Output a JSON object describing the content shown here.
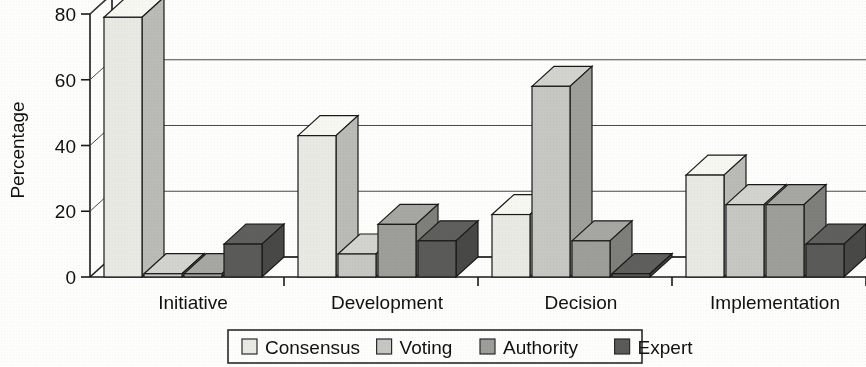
{
  "chart_data": {
    "type": "bar",
    "title": "",
    "subtitle": "",
    "xlabel": "",
    "ylabel": "Percentage",
    "ylim": [
      0,
      80
    ],
    "yticks": [
      0,
      20,
      40,
      60,
      80
    ],
    "ytick_labels": [
      "0",
      "20",
      "40",
      "60",
      "80"
    ],
    "grid": true,
    "three_d": true,
    "legend_position": "bottom",
    "categories": [
      "Initiative",
      "Development",
      "Decision",
      "Implementation"
    ],
    "series": [
      {
        "name": "Consensus",
        "color": "#e9e9e4",
        "values": [
          79,
          43,
          19,
          31
        ]
      },
      {
        "name": "Voting",
        "color": "#c6c6c2",
        "values": [
          1,
          7,
          58,
          22
        ]
      },
      {
        "name": "Authority",
        "color": "#9d9d9a",
        "values": [
          1,
          16,
          11,
          22
        ]
      },
      {
        "name": "Expert",
        "color": "#5a5a58",
        "values": [
          10,
          11,
          1,
          10
        ]
      }
    ]
  },
  "axes": {
    "y_axis_title": "Percentage",
    "y_tick_labels": [
      "80",
      "60",
      "40",
      "20",
      "0"
    ],
    "x_tick_labels": [
      "Initiative",
      "Development",
      "Decision",
      "Implementation"
    ]
  },
  "legend": {
    "items": [
      {
        "label": "Consensus",
        "color": "#e9e9e4"
      },
      {
        "label": "Voting",
        "color": "#c6c6c2"
      },
      {
        "label": "Authority",
        "color": "#9d9d9a"
      },
      {
        "label": "Expert",
        "color": "#5a5a58"
      }
    ]
  }
}
